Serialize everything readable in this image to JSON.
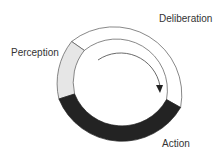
{
  "diagram": {
    "title": "",
    "cycle": [
      {
        "label": "Perception",
        "fill": "#e6e6e6"
      },
      {
        "label": "Deliberation",
        "fill": "#ffffff"
      },
      {
        "label": "Action",
        "fill": "#222222"
      }
    ],
    "arrow": "clockwise"
  },
  "labels": {
    "perception": "Perception",
    "deliberation": "Deliberation",
    "action": "Action"
  }
}
